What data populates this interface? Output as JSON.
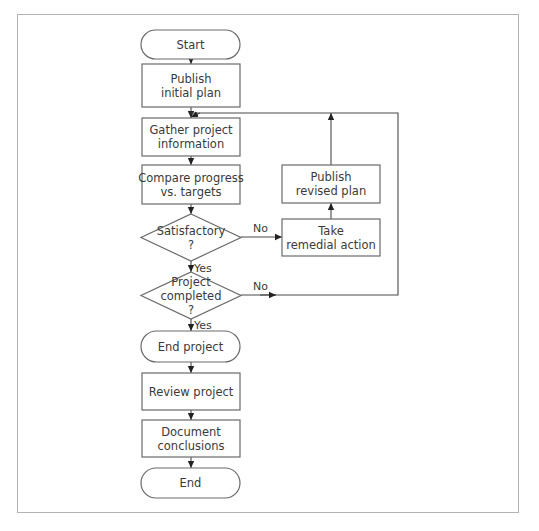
{
  "diagram": {
    "type": "flowchart",
    "nodes": [
      {
        "id": "start",
        "kind": "terminal",
        "lines": [
          "Start"
        ]
      },
      {
        "id": "publish_initial",
        "kind": "process",
        "lines": [
          "Publish",
          "initial plan"
        ]
      },
      {
        "id": "gather",
        "kind": "process",
        "lines": [
          "Gather project",
          "information"
        ]
      },
      {
        "id": "compare",
        "kind": "process",
        "lines": [
          "Compare progress",
          "vs. targets"
        ]
      },
      {
        "id": "satisfactory",
        "kind": "decision",
        "lines": [
          "Satisfactory",
          "?"
        ]
      },
      {
        "id": "completed",
        "kind": "decision",
        "lines": [
          "Project",
          "completed",
          "?"
        ]
      },
      {
        "id": "end_project",
        "kind": "terminal",
        "lines": [
          "End project"
        ]
      },
      {
        "id": "review",
        "kind": "process",
        "lines": [
          "Review project"
        ]
      },
      {
        "id": "document",
        "kind": "process",
        "lines": [
          "Document",
          "conclusions"
        ]
      },
      {
        "id": "end",
        "kind": "terminal",
        "lines": [
          "End"
        ]
      },
      {
        "id": "remedial",
        "kind": "process",
        "lines": [
          "Take",
          "remedial action"
        ]
      },
      {
        "id": "publish_revised",
        "kind": "process",
        "lines": [
          "Publish",
          "revised plan"
        ]
      }
    ],
    "edges": [
      {
        "from": "start",
        "to": "publish_initial",
        "label": ""
      },
      {
        "from": "publish_initial",
        "to": "gather",
        "label": ""
      },
      {
        "from": "gather",
        "to": "compare",
        "label": ""
      },
      {
        "from": "compare",
        "to": "satisfactory",
        "label": ""
      },
      {
        "from": "satisfactory",
        "to": "remedial",
        "label": "No"
      },
      {
        "from": "satisfactory",
        "to": "completed",
        "label": "Yes"
      },
      {
        "from": "remedial",
        "to": "publish_revised",
        "label": ""
      },
      {
        "from": "publish_revised",
        "to": "gather",
        "label": ""
      },
      {
        "from": "completed",
        "to": "gather",
        "label": "No"
      },
      {
        "from": "completed",
        "to": "end_project",
        "label": "Yes"
      },
      {
        "from": "end_project",
        "to": "review",
        "label": ""
      },
      {
        "from": "review",
        "to": "document",
        "label": ""
      },
      {
        "from": "document",
        "to": "end",
        "label": ""
      }
    ]
  }
}
